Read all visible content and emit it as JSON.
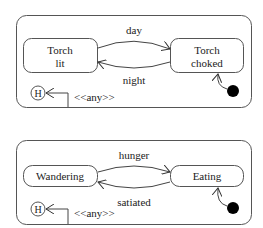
{
  "diagrams": [
    {
      "name": "torch-statechart",
      "states": [
        {
          "id": "torch-lit",
          "lines": [
            "Torch",
            "lit"
          ]
        },
        {
          "id": "torch-choked",
          "lines": [
            "Torch",
            "choked"
          ]
        }
      ],
      "transitions": [
        {
          "label": "day",
          "from": "torch-lit",
          "to": "torch-choked"
        },
        {
          "label": "night",
          "from": "torch-choked",
          "to": "torch-lit"
        }
      ],
      "history": {
        "label": "H",
        "trigger": "<<any>>"
      },
      "initial": "torch-choked"
    },
    {
      "name": "creature-statechart",
      "states": [
        {
          "id": "wandering",
          "lines": [
            "Wandering"
          ]
        },
        {
          "id": "eating",
          "lines": [
            "Eating"
          ]
        }
      ],
      "transitions": [
        {
          "label": "hunger",
          "from": "wandering",
          "to": "eating"
        },
        {
          "label": "satiated",
          "from": "eating",
          "to": "wandering"
        }
      ],
      "history": {
        "label": "H",
        "trigger": "<<any>>"
      },
      "initial": "eating"
    }
  ]
}
